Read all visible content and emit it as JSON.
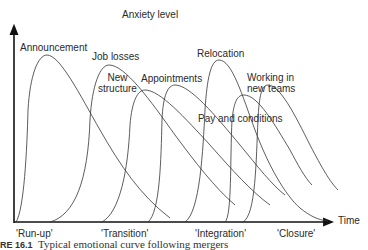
{
  "diagram": {
    "y_axis_label": "Anxiety level",
    "x_axis_label": "Time",
    "phases": [
      "'Run-up'",
      "'Transition'",
      "'Integration'",
      "'Closure'"
    ],
    "curves": [
      {
        "label": "Announcement"
      },
      {
        "label": "Job losses"
      },
      {
        "label": "New structure",
        "lines": [
          "New",
          "structure"
        ]
      },
      {
        "label": "Appointments"
      },
      {
        "label": "Relocation"
      },
      {
        "label": "Pay and conditions"
      },
      {
        "label": "Working in new teams",
        "lines": [
          "Working in",
          "new teams"
        ]
      }
    ],
    "caption": {
      "number": "RE 16.1",
      "text": "Typical emotional curve following mergers"
    },
    "colors": {
      "line": "#333333",
      "axis": "#111111",
      "background": "#ffffff"
    }
  }
}
